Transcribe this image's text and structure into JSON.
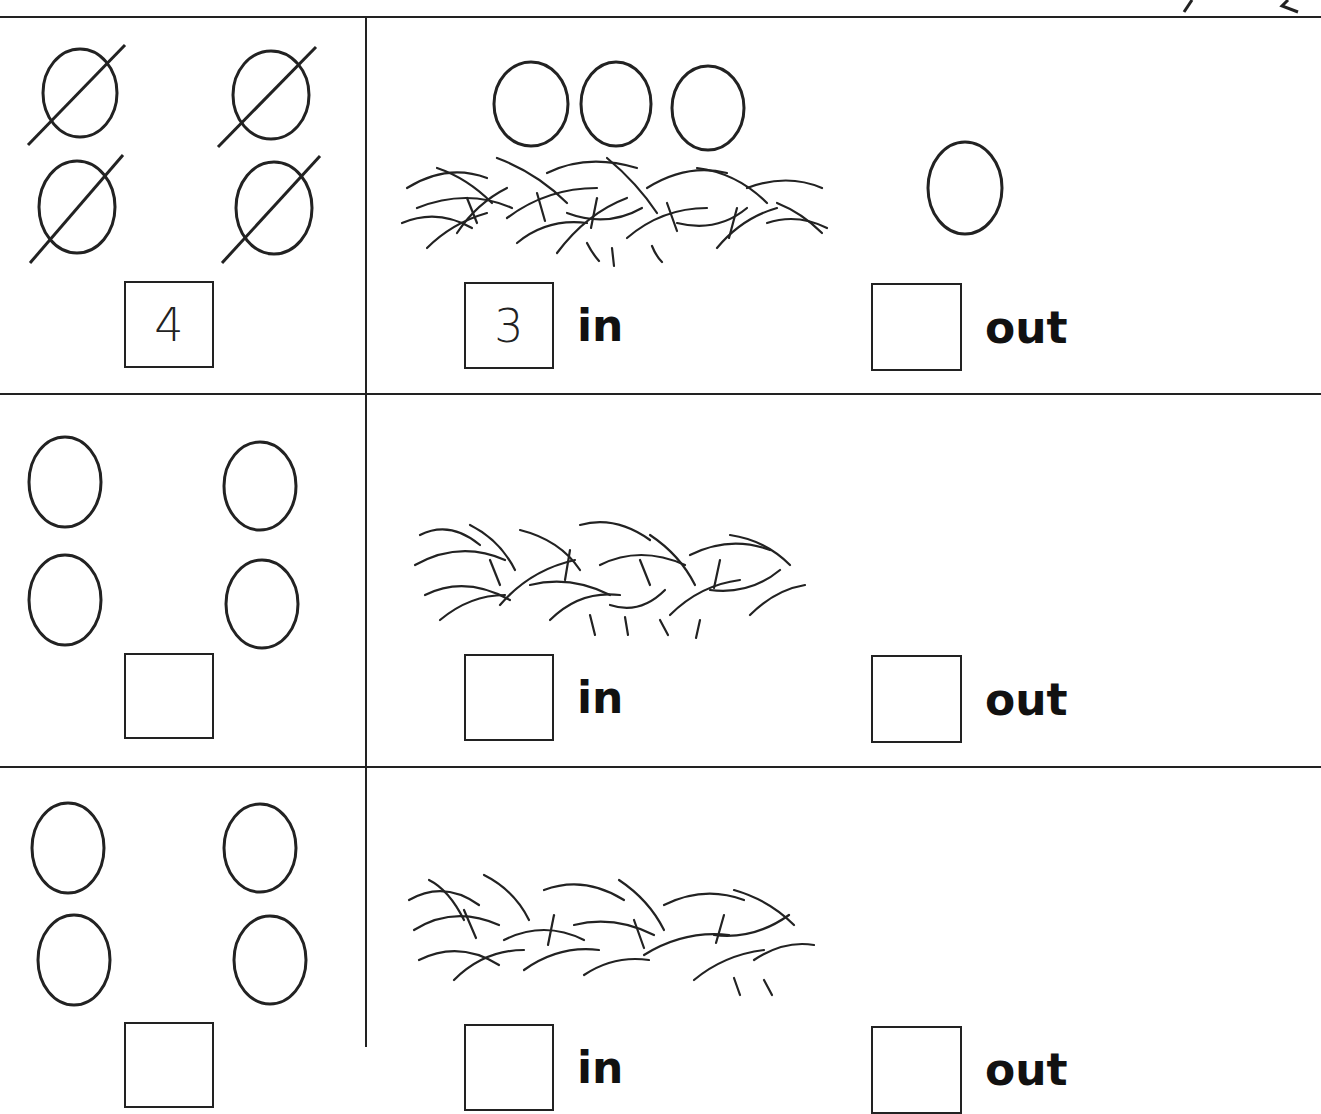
{
  "worksheet": {
    "rows": [
      {
        "eggs_total": 4,
        "eggs_crossed_out": true,
        "total_box_value": "4",
        "nest_eggs_count": 3,
        "loose_eggs_count": 1,
        "in_box_value": "3",
        "in_label": "in",
        "out_box_value": "",
        "out_label": "out"
      },
      {
        "eggs_total": 4,
        "eggs_crossed_out": false,
        "total_box_value": "",
        "nest_eggs_count": 0,
        "loose_eggs_count": 0,
        "in_box_value": "",
        "in_label": "in",
        "out_box_value": "",
        "out_label": "out"
      },
      {
        "eggs_total": 4,
        "eggs_crossed_out": false,
        "total_box_value": "",
        "nest_eggs_count": 0,
        "loose_eggs_count": 0,
        "in_box_value": "",
        "in_label": "in",
        "out_box_value": "",
        "out_label": "out"
      }
    ]
  },
  "colors": {
    "ink": "#222222",
    "paper": "#ffffff"
  }
}
